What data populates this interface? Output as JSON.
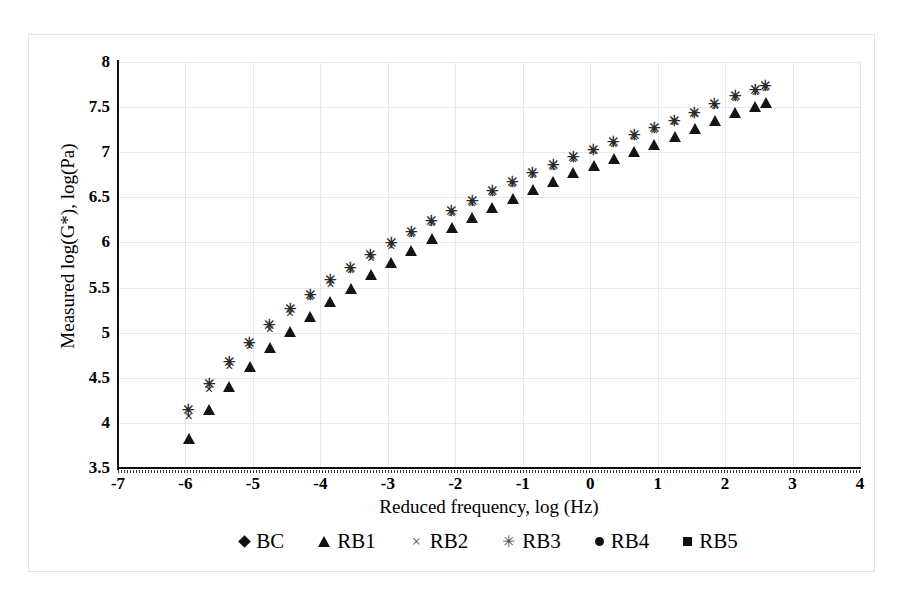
{
  "chart_data": {
    "type": "scatter",
    "title": "",
    "xlabel": "Reduced frequency, log (Hz)",
    "ylabel": "Measured log(G*), log(Pa)",
    "xlim": [
      -7,
      4
    ],
    "ylim": [
      3.5,
      8
    ],
    "xticks": [
      -7,
      -6,
      -5,
      -4,
      -3,
      -2,
      -1,
      0,
      1,
      2,
      3,
      4
    ],
    "xtick_labels": [
      "-7",
      "-6",
      "-5",
      "-4",
      "-3",
      "-2",
      "-1",
      "0",
      "1",
      "2",
      "3",
      "4"
    ],
    "yticks": [
      3.5,
      4,
      4.5,
      5,
      5.5,
      6,
      6.5,
      7,
      7.5,
      8
    ],
    "ytick_labels": [
      "3.5",
      "4",
      "4.5",
      "5",
      "5.5",
      "6",
      "6.5",
      "7",
      "7.5",
      "8"
    ],
    "grid": true,
    "legend_position": "bottom",
    "marker_color": "#141414",
    "series": [
      {
        "name": "BC",
        "marker": "diamond",
        "x": [
          -5.65,
          -5.35,
          -5.05,
          -4.75,
          -4.45,
          -4.15,
          -3.85,
          -3.55,
          -3.25,
          -2.95,
          -2.65,
          -2.35,
          -2.05,
          -1.75,
          -1.45,
          -1.15,
          -0.85,
          -0.55,
          -0.25,
          0.05,
          0.35,
          0.65,
          0.95,
          1.25,
          1.55,
          1.85,
          2.15,
          2.45,
          2.6
        ],
        "y": [
          3.62,
          3.95,
          4.22,
          4.42,
          4.62,
          4.82,
          5.0,
          5.18,
          5.35,
          5.52,
          5.68,
          5.84,
          5.99,
          6.13,
          6.27,
          6.4,
          6.52,
          6.63,
          6.74,
          6.84,
          6.94,
          7.03,
          7.12,
          7.2,
          7.28,
          7.38,
          7.47,
          7.56,
          7.6
        ]
      },
      {
        "name": "RB1",
        "marker": "triangle",
        "x": [
          -5.95,
          -5.65,
          -5.35,
          -5.05,
          -4.75,
          -4.45,
          -4.15,
          -3.85,
          -3.55,
          -3.25,
          -2.95,
          -2.65,
          -2.35,
          -2.05,
          -1.75,
          -1.45,
          -1.15,
          -0.85,
          -0.55,
          -0.25,
          0.05,
          0.35,
          0.65,
          0.95,
          1.25,
          1.55,
          1.85,
          2.15,
          2.45,
          2.6
        ],
        "y": [
          3.98,
          4.3,
          4.55,
          4.78,
          4.98,
          5.16,
          5.33,
          5.49,
          5.64,
          5.79,
          5.93,
          6.06,
          6.19,
          6.31,
          6.43,
          6.54,
          6.64,
          6.74,
          6.83,
          6.92,
          7.0,
          7.08,
          7.16,
          7.24,
          7.32,
          7.41,
          7.5,
          7.59,
          7.66,
          7.7
        ]
      },
      {
        "name": "RB2",
        "marker": "x",
        "x": [
          -5.95,
          -5.65,
          -5.35,
          -5.05,
          -4.75,
          -4.45,
          -4.15,
          -3.85,
          -3.55,
          -3.25,
          -2.95,
          -2.65,
          -2.35,
          -2.05,
          -1.75,
          -1.45,
          -1.15,
          -0.85,
          -0.55,
          -0.25,
          0.05,
          0.35,
          0.65,
          0.95,
          1.25,
          1.55,
          1.85,
          2.15,
          2.45,
          2.6
        ],
        "y": [
          4.08,
          4.38,
          4.63,
          4.85,
          5.04,
          5.22,
          5.39,
          5.54,
          5.69,
          5.83,
          5.96,
          6.09,
          6.21,
          6.33,
          6.44,
          6.55,
          6.65,
          6.75,
          6.84,
          6.93,
          7.01,
          7.09,
          7.17,
          7.25,
          7.33,
          7.42,
          7.51,
          7.6,
          7.67,
          7.71
        ]
      },
      {
        "name": "RB3",
        "marker": "star",
        "x": [
          -5.95,
          -5.65,
          -5.35,
          -5.05,
          -4.75,
          -4.45,
          -4.15,
          -3.85,
          -3.55,
          -3.25,
          -2.95,
          -2.65,
          -2.35,
          -2.05,
          -1.75,
          -1.45,
          -1.15,
          -0.85,
          -0.55,
          -0.25,
          0.05,
          0.35,
          0.65,
          0.95,
          1.25,
          1.55,
          1.85,
          2.15,
          2.45,
          2.6
        ],
        "y": [
          4.14,
          4.43,
          4.68,
          4.89,
          5.08,
          5.26,
          5.42,
          5.58,
          5.72,
          5.86,
          5.99,
          6.12,
          6.24,
          6.35,
          6.46,
          6.57,
          6.67,
          6.77,
          6.86,
          6.95,
          7.03,
          7.11,
          7.19,
          7.27,
          7.35,
          7.44,
          7.53,
          7.62,
          7.69,
          7.73
        ]
      },
      {
        "name": "RB4",
        "marker": "circle",
        "x": [
          -5.95,
          -5.65,
          -5.35,
          -5.05,
          -4.75,
          -4.45,
          -4.15,
          -3.85,
          -3.55,
          -3.25,
          -2.95,
          -2.65,
          -2.35,
          -2.05,
          -1.75,
          -1.45,
          -1.15,
          -0.85,
          -0.55,
          -0.25,
          0.05,
          0.35,
          0.65,
          0.95,
          1.25,
          1.55,
          1.85,
          2.15,
          2.45,
          2.6
        ],
        "y": [
          4.12,
          4.41,
          4.66,
          4.87,
          5.06,
          5.24,
          5.41,
          5.56,
          5.71,
          5.85,
          5.98,
          6.11,
          6.23,
          6.34,
          6.45,
          6.56,
          6.66,
          6.76,
          6.85,
          6.94,
          7.02,
          7.1,
          7.18,
          7.26,
          7.34,
          7.43,
          7.52,
          7.61,
          7.68,
          7.72
        ]
      },
      {
        "name": "RB5",
        "marker": "square",
        "x": [
          -5.8,
          -5.5,
          -5.2,
          -4.9,
          -4.6,
          -4.3,
          -4.0,
          -3.7,
          -3.4,
          -3.1,
          -2.8,
          -2.5,
          -2.2,
          -1.9,
          -1.6,
          -1.3,
          -1.0,
          -0.7,
          -0.4,
          -0.1,
          0.2,
          0.5,
          0.8,
          1.1,
          1.4,
          1.7,
          2.0,
          2.3,
          2.55
        ],
        "y": [
          3.82,
          4.14,
          4.4,
          4.62,
          4.82,
          5.0,
          5.17,
          5.33,
          5.48,
          5.63,
          5.77,
          5.9,
          6.03,
          6.16,
          6.28,
          6.4,
          6.51,
          6.61,
          6.71,
          6.81,
          6.9,
          6.99,
          7.08,
          7.16,
          7.25,
          7.34,
          7.44,
          7.53,
          7.62
        ]
      }
    ]
  },
  "legend": {
    "items": [
      {
        "label": "BC",
        "marker": "diamond"
      },
      {
        "label": "RB1",
        "marker": "triangle"
      },
      {
        "label": "RB2",
        "marker": "x"
      },
      {
        "label": "RB3",
        "marker": "star"
      },
      {
        "label": "RB4",
        "marker": "circle"
      },
      {
        "label": "RB5",
        "marker": "square"
      }
    ]
  },
  "glyphs": {
    "x": "×",
    "star": "✳"
  }
}
